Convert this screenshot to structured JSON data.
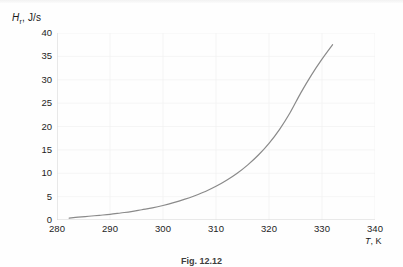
{
  "figure": {
    "caption": "Fig. 12.12",
    "background_color": "#fefefe"
  },
  "axis_labels": {
    "y_symbol": "H",
    "y_subscript": "r",
    "y_unit": ", J/s",
    "x_symbol": "T",
    "x_unit": ", K"
  },
  "chart_data": {
    "type": "line",
    "title": "",
    "subtitle": "",
    "xlabel": "T, K",
    "ylabel": "H_r, J/s",
    "xlim": [
      280,
      340
    ],
    "ylim": [
      0,
      40
    ],
    "xticks": [
      280,
      290,
      300,
      310,
      320,
      330,
      340
    ],
    "yticks": [
      0,
      5,
      10,
      15,
      20,
      25,
      30,
      35,
      40
    ],
    "grid": true,
    "grid_color": "#f0f0f0",
    "legend": null,
    "legend_position": "none",
    "annotations": [],
    "series": [
      {
        "name": "H_r",
        "color": "#8a8a8a",
        "line_width": 1.2,
        "x": [
          282.3,
          284,
          286,
          288,
          290,
          292,
          294,
          296,
          298,
          300,
          302,
          304,
          306,
          308,
          310,
          312,
          314,
          316,
          318,
          320,
          322,
          324,
          326,
          328,
          330,
          332
        ],
        "values": [
          0.4,
          0.6,
          0.8,
          1.0,
          1.2,
          1.5,
          1.8,
          2.2,
          2.6,
          3.1,
          3.7,
          4.4,
          5.2,
          6.1,
          7.2,
          8.5,
          10.0,
          11.8,
          13.9,
          16.4,
          19.4,
          23.0,
          27.2,
          31.0,
          34.4,
          37.5
        ]
      }
    ]
  }
}
